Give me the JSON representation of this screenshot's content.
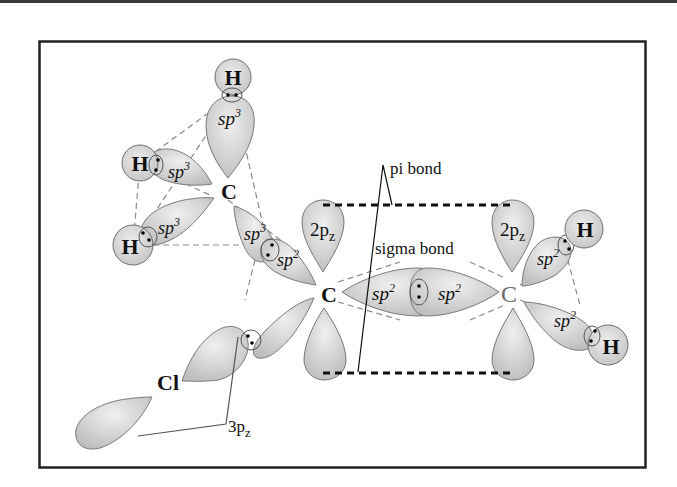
{
  "diagram": {
    "colors": {
      "frame": "#222222",
      "lobe_fill_light": "#e6e6e6",
      "lobe_fill_dark": "#b8b8b8",
      "lobe_stroke": "#7a7a7a",
      "dashed_bond": "#8a8a8a",
      "pi_dash": "#111111"
    },
    "atoms": {
      "h_top": "H",
      "h_left": "H",
      "h_lower_left": "H",
      "c_sp3": "C",
      "c_left_sp2": "C",
      "c_right_sp2": "C",
      "h_right_upper": "H",
      "h_right_lower": "H",
      "cl": "Cl"
    },
    "orbital_labels": {
      "sp3_top": "sp",
      "sp3_top_sup": "3",
      "sp3_left": "sp",
      "sp3_left_sup": "3",
      "sp3_lower": "sp",
      "sp3_lower_sup": "3",
      "sp3_to_c": "sp",
      "sp3_to_c_sup": "3",
      "sp2_to_ch3": "sp",
      "sp2_to_ch3_sup": "2",
      "sigma_left": "sp",
      "sigma_left_sup": "2",
      "sigma_right": "sp",
      "sigma_right_sup": "2",
      "sp2_right_upper": "sp",
      "sp2_right_upper_sup": "2",
      "sp2_right_lower": "sp",
      "sp2_right_lower_sup": "2",
      "pz_left": "2p",
      "pz_left_sub": "z",
      "pz_right": "2p",
      "pz_right_sub": "z",
      "cl_pz": "3p",
      "cl_pz_sub": "z"
    },
    "annotations": {
      "pi_bond": "pi bond",
      "sigma_bond": "sigma bond"
    }
  }
}
